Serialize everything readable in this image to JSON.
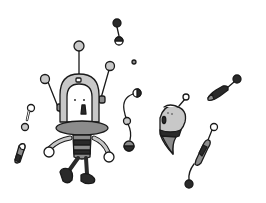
{
  "image": {
    "width": 266,
    "height": 203,
    "background": "#ffffff",
    "subject": "Cartoon robot with scattered floating robot parts",
    "palette": {
      "outline": "#1a1a1a",
      "light_gray": "#c8c8c8",
      "mid_gray": "#8c8c8c",
      "dark": "#2a2a2a",
      "white": "#ffffff"
    }
  },
  "elements": [
    {
      "name": "main-robot",
      "description": "Robot with arched head, three antennae, saucer collar, striped torso, round hands, dark feet"
    },
    {
      "name": "ghost-robot-part",
      "description": "Teardrop-shaped head with open mouth and antenna"
    },
    {
      "name": "dumbbell-part-top",
      "description": "Small black dumbbell piece near top center"
    },
    {
      "name": "chain-part",
      "description": "Curved wire with half-shaded balls"
    },
    {
      "name": "capsule-part-right",
      "description": "Dark capsule on stick with ball end"
    },
    {
      "name": "capsule-part-bottom-right",
      "description": "Striped capsule on curved wire ending in black ball"
    },
    {
      "name": "bone-part-left",
      "description": "Small dumbbell bone on the left"
    },
    {
      "name": "battery-part-left",
      "description": "Small shaded battery cylinder on the left"
    }
  ]
}
